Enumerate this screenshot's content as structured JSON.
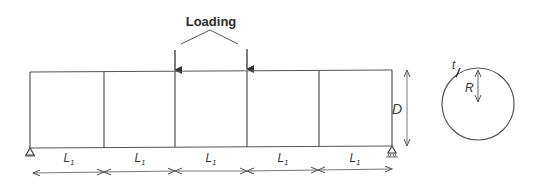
{
  "diagram": {
    "type": "structural-beam-schematic",
    "loading_label": "Loading",
    "beam": {
      "panel_count": 5,
      "span_label": "L",
      "span_subscript": "1",
      "spans": [
        {
          "label": "L",
          "sub": "1"
        },
        {
          "label": "L",
          "sub": "1"
        },
        {
          "label": "L",
          "sub": "1"
        },
        {
          "label": "L",
          "sub": "1"
        },
        {
          "label": "L",
          "sub": "1"
        }
      ],
      "depth_label": "D",
      "supports": [
        "pin",
        "roller"
      ],
      "point_loads": 2
    },
    "cross_section": {
      "shape": "circle",
      "radius_label": "R",
      "thickness_label": "t"
    },
    "colors": {
      "line": "#555555",
      "text": "#333333",
      "background": "#ffffff"
    }
  }
}
